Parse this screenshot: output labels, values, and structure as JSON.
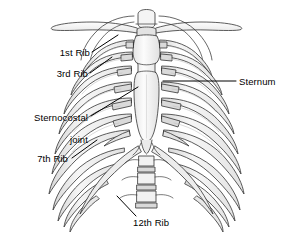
{
  "figure": {
    "width": 293,
    "height": 238,
    "background_color": "#ffffff",
    "line_color": "#333333",
    "bone_fill_light": "#fbfbfb",
    "bone_fill_mid": "#ececec",
    "bone_fill_shadow": "#dcdcdc",
    "text_color": "#000000"
  },
  "labels": [
    {
      "id": "first-rib",
      "text": "1st Rib",
      "x": 42,
      "y": 47,
      "align": "right-align",
      "width": 48,
      "leader": {
        "x1": 92,
        "y1": 52,
        "x2": 118,
        "y2": 35
      }
    },
    {
      "id": "third-rib",
      "text": "3rd Rib",
      "x": 40,
      "y": 68,
      "align": "right-align",
      "width": 48,
      "leader": {
        "x1": 90,
        "y1": 73,
        "x2": 112,
        "y2": 57
      }
    },
    {
      "id": "sternocostal-joint",
      "text_line_1": "Sternocostal",
      "text_line_2": "joint",
      "x": 12,
      "y": 101,
      "align": "right-align",
      "width": 76,
      "leader": {
        "x1": 91,
        "y1": 116,
        "x2": 138,
        "y2": 87
      }
    },
    {
      "id": "seventh-rib",
      "text": "7th Rib",
      "x": 20,
      "y": 153,
      "align": "right-align",
      "width": 48,
      "leader": {
        "x1": 72,
        "y1": 158,
        "x2": 97,
        "y2": 140
      }
    },
    {
      "id": "sternum",
      "text": "Sternum",
      "x": 239,
      "y": 76,
      "align": "left-align",
      "width": 52,
      "leader": {
        "x1": 236,
        "y1": 81,
        "x2": 163,
        "y2": 81
      }
    },
    {
      "id": "twelfth-rib",
      "text": "12th Rib",
      "x": 133,
      "y": 217,
      "align": "left-align",
      "width": 54,
      "leader": {
        "x1": 136,
        "y1": 216,
        "x2": 117,
        "y2": 196
      }
    }
  ]
}
